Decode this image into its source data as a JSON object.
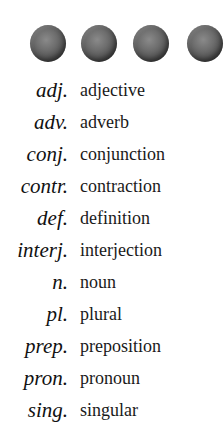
{
  "decoration": {
    "dots": [
      {
        "left": 30
      },
      {
        "left": 81
      },
      {
        "left": 133
      },
      {
        "left": 187
      }
    ],
    "dot_color": "#5a5a5a"
  },
  "legend": {
    "items": [
      {
        "abbr": "adj.",
        "term": "adjective"
      },
      {
        "abbr": "adv.",
        "term": "adverb"
      },
      {
        "abbr": "conj.",
        "term": "conjunction"
      },
      {
        "abbr": "contr.",
        "term": "contraction"
      },
      {
        "abbr": "def.",
        "term": "definition"
      },
      {
        "abbr": "interj.",
        "term": "interjection"
      },
      {
        "abbr": "n.",
        "term": "noun"
      },
      {
        "abbr": "pl.",
        "term": "plural"
      },
      {
        "abbr": "prep.",
        "term": "preposition"
      },
      {
        "abbr": "pron.",
        "term": "pronoun"
      },
      {
        "abbr": "sing.",
        "term": "singular"
      }
    ]
  }
}
